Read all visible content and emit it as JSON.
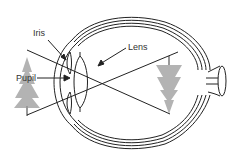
{
  "diagram": {
    "labels": {
      "iris": "Iris",
      "lens": "Lens",
      "pupil": "Pupil"
    },
    "objects": {
      "object_tree": "upright tree",
      "image_tree": "inverted tree on retina"
    },
    "colors": {
      "line": "#222222",
      "tree": "#b0b0b0",
      "label": "#333333"
    }
  }
}
